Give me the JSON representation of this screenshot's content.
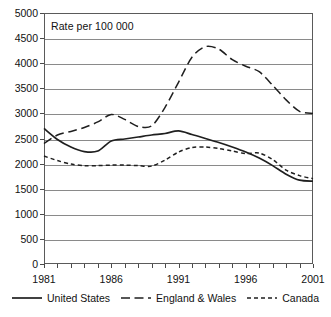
{
  "chart_data": {
    "type": "line",
    "title": "Rate per 100 000",
    "xlabel": "",
    "ylabel": "",
    "xlim": [
      1981,
      2001
    ],
    "ylim": [
      0,
      5000
    ],
    "grid": "horizontal",
    "legend_position": "bottom",
    "y_ticks": [
      5000,
      4500,
      4000,
      3500,
      3000,
      2500,
      2000,
      1500,
      1000,
      500,
      0
    ],
    "x_ticks": [
      1981,
      1982,
      1983,
      1984,
      1985,
      1986,
      1987,
      1988,
      1989,
      1990,
      1991,
      1992,
      1993,
      1994,
      1995,
      1996,
      1997,
      1998,
      1999,
      2000,
      2001
    ],
    "x_tick_labels": [
      "1981",
      "",
      "",
      "",
      "",
      "1986",
      "",
      "",
      "",
      "",
      "1991",
      "",
      "",
      "",
      "",
      "1996",
      "",
      "",
      "",
      "",
      "2001"
    ],
    "x": [
      1981,
      1982,
      1983,
      1984,
      1985,
      1986,
      1987,
      1988,
      1989,
      1990,
      1991,
      1992,
      1993,
      1994,
      1995,
      1996,
      1997,
      1998,
      1999,
      2000,
      2001
    ],
    "series": [
      {
        "name": "United States",
        "style": "solid",
        "color": "#1f1f1f",
        "values": [
          2700,
          2480,
          2330,
          2240,
          2250,
          2450,
          2490,
          2530,
          2570,
          2600,
          2650,
          2580,
          2500,
          2420,
          2330,
          2230,
          2110,
          1960,
          1790,
          1670,
          1650
        ]
      },
      {
        "name": "England & Wales",
        "style": "long-dash",
        "color": "#1f1f1f",
        "values": [
          2400,
          2570,
          2640,
          2720,
          2830,
          2980,
          2880,
          2740,
          2750,
          3120,
          3620,
          4120,
          4330,
          4280,
          4070,
          3940,
          3830,
          3560,
          3270,
          3040,
          3000
        ]
      },
      {
        "name": "Canada",
        "style": "short-dash",
        "color": "#1f1f1f",
        "values": [
          2150,
          2060,
          1990,
          1960,
          1960,
          1970,
          1970,
          1960,
          1950,
          2070,
          2230,
          2320,
          2330,
          2300,
          2250,
          2200,
          2210,
          2080,
          1870,
          1760,
          1700
        ]
      }
    ]
  },
  "legend": {
    "entries": [
      {
        "label": "United States",
        "style": "solid"
      },
      {
        "label": "England & Wales",
        "style": "long-dash"
      },
      {
        "label": "Canada",
        "style": "short-dash"
      }
    ]
  }
}
